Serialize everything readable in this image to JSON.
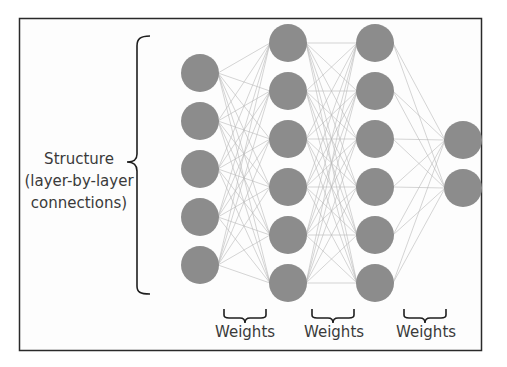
{
  "diagram": {
    "structure_label": {
      "line1": "Structure",
      "line2": "(layer-by-layer",
      "line3": "connections)"
    },
    "weights_labels": [
      "Weights",
      "Weights",
      "Weights"
    ],
    "layers": [
      {
        "name": "input",
        "x": 200,
        "nodes_y": [
          73,
          121,
          169,
          217,
          265
        ]
      },
      {
        "name": "hidden-1",
        "x": 288,
        "nodes_y": [
          43,
          91,
          139,
          187,
          235,
          283
        ]
      },
      {
        "name": "hidden-2",
        "x": 375,
        "nodes_y": [
          43,
          91,
          139,
          187,
          235,
          283
        ]
      },
      {
        "name": "output",
        "x": 463,
        "nodes_y": [
          140,
          188
        ]
      }
    ],
    "node_radius": 19,
    "colors": {
      "node": "#8c8c8c",
      "edge": "#b9b9b9",
      "frame": "#2a2a2a",
      "text": "#3a3a3a"
    }
  }
}
